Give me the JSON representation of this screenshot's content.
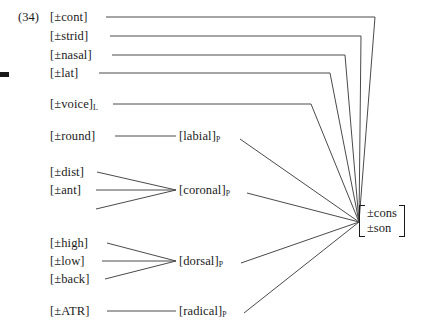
{
  "example": {
    "number": "(34)"
  },
  "terminal_features": [
    {
      "id": "cont",
      "label": "[±cont]"
    },
    {
      "id": "strid",
      "label": "[±strid]"
    },
    {
      "id": "nasal",
      "label": "[±nasal]"
    },
    {
      "id": "lat",
      "label": "[±lat]"
    },
    {
      "id": "voice",
      "label": "[±voice]",
      "subscript": "L"
    },
    {
      "id": "round",
      "label": "[±round]"
    },
    {
      "id": "dist",
      "label": "[±dist]"
    },
    {
      "id": "ant",
      "label": "[±ant]"
    },
    {
      "id": "high",
      "label": "[±high]"
    },
    {
      "id": "low",
      "label": "[±low]"
    },
    {
      "id": "back",
      "label": "[±back]"
    },
    {
      "id": "atr",
      "label": "[±ATR]"
    }
  ],
  "place_nodes": [
    {
      "id": "labial",
      "label": "[labial]",
      "subscript": "P"
    },
    {
      "id": "coronal",
      "label": "[coronal]",
      "subscript": "P"
    },
    {
      "id": "dorsal",
      "label": "[dorsal]",
      "subscript": "P"
    },
    {
      "id": "radical",
      "label": "[radical]",
      "subscript": "P"
    }
  ],
  "root_node": {
    "line1": "±cons",
    "line2": "±son"
  },
  "style": {
    "line_color": "#4a4a4a",
    "text_color": "#1a1a1a",
    "background": "#ffffff"
  }
}
